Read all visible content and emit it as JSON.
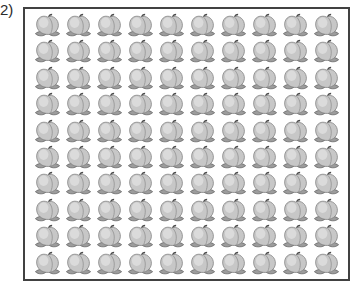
{
  "label": "2)",
  "figure": {
    "type": "pictograph-grid",
    "item": "peach",
    "rows": 10,
    "columns": 10,
    "total": 100
  },
  "colors": {
    "background": "#ffffff",
    "frame_border": "#414141",
    "fruit_body": "#c7c7c7",
    "fruit_highlight": "#dedede",
    "fruit_outline": "#7e7e7e",
    "leaf_fill": "#9c9c9c",
    "leaf_outline": "#5a5a5a",
    "stem": "#4a4a4a"
  }
}
